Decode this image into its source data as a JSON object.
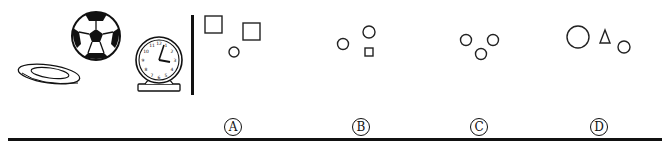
{
  "question": {
    "reference_group": {
      "objects": [
        "plate",
        "soccer-ball",
        "clock"
      ]
    },
    "options": [
      {
        "key": "A",
        "label": "Ⓐ",
        "shapes": [
          "square",
          "square",
          "circle"
        ]
      },
      {
        "key": "B",
        "label": "Ⓑ",
        "shapes": [
          "circle",
          "circle",
          "square"
        ]
      },
      {
        "key": "C",
        "label": "Ⓒ",
        "shapes": [
          "circle",
          "circle",
          "circle"
        ]
      },
      {
        "key": "D",
        "label": "Ⓓ",
        "shapes": [
          "circle",
          "triangle",
          "circle"
        ]
      }
    ]
  },
  "colors": {
    "ink": "#111111",
    "background": "#ffffff"
  }
}
